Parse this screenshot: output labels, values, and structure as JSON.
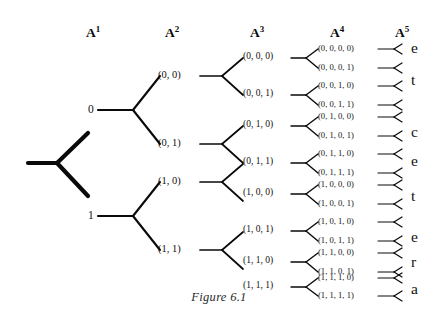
{
  "figure": {
    "caption": "Figure 6.1",
    "headers": [
      {
        "base": "A",
        "exp": "1"
      },
      {
        "base": "A",
        "exp": "2"
      },
      {
        "base": "A",
        "exp": "3"
      },
      {
        "base": "A",
        "exp": "4"
      },
      {
        "base": "A",
        "exp": "5"
      }
    ],
    "level1": [
      {
        "label": "0"
      },
      {
        "label": "1"
      }
    ],
    "level2": [
      {
        "label": "(0, 0)"
      },
      {
        "label": "(0, 1)"
      },
      {
        "label": "(1, 0)"
      },
      {
        "label": "(1, 1)"
      }
    ],
    "level3": [
      {
        "label": "(0, 0, 0)"
      },
      {
        "label": "(0, 0, 1)"
      },
      {
        "label": "(0, 1, 0)"
      },
      {
        "label": "(0, 1, 1)"
      },
      {
        "label": "(1, 0, 0)"
      },
      {
        "label": "(1, 0, 1)"
      },
      {
        "label": "(1, 1, 0)"
      },
      {
        "label": "(1, 1, 1)"
      }
    ],
    "level4": [
      {
        "label": "(0, 0, 0, 0)"
      },
      {
        "label": "(0, 0, 0, 1)"
      },
      {
        "label": "(0, 0, 1, 0)"
      },
      {
        "label": "(0, 0, 1, 1)"
      },
      {
        "label": "(0, 1, 0, 0)"
      },
      {
        "label": "(0, 1, 0, 1)"
      },
      {
        "label": "(0, 1, 1, 0)"
      },
      {
        "label": "(0, 1, 1, 1)"
      },
      {
        "label": "(1, 0, 0, 0)"
      },
      {
        "label": "(1, 0, 0, 1)"
      },
      {
        "label": "(1, 0, 1, 0)"
      },
      {
        "label": "(1, 0, 1, 1)"
      },
      {
        "label": "(1, 1, 0, 0)"
      },
      {
        "label": "(1, 1, 0, 1)"
      },
      {
        "label": "(1, 1, 1, 0)"
      },
      {
        "label": "(1, 1, 1, 1)"
      }
    ],
    "leaf_letters": [
      {
        "label": "e"
      },
      {
        "label": "t"
      },
      {
        "label": "c"
      },
      {
        "label": "e"
      },
      {
        "label": "t"
      },
      {
        "label": "e"
      },
      {
        "label": "r"
      },
      {
        "label": "a"
      }
    ],
    "colors": {
      "ink": "#0a0a0a",
      "background": "#ffffff",
      "caption": "#2a2a2a"
    }
  }
}
